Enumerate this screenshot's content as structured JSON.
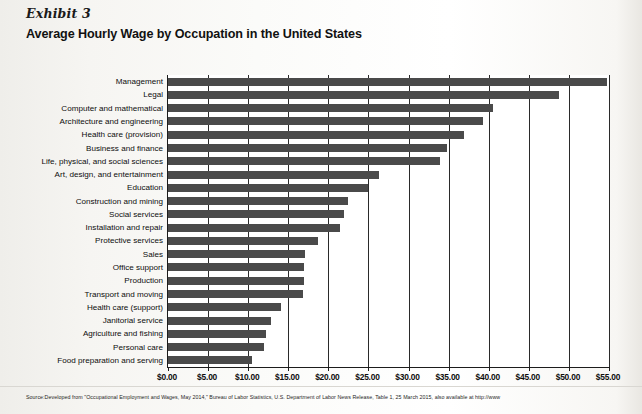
{
  "header": {
    "exhibit_label": "Exhibit 3",
    "title": "Average Hourly Wage by Occupation in the United States"
  },
  "source": {
    "text": "Source:Developed from \"Occupational Employment and Wages, May 2014,\" Bureau of Labor Statistics, U.S. Department of Labor News Release, Table 1, 25 March 2015, also available at http://www"
  },
  "chart_data": {
    "type": "bar",
    "orientation": "horizontal",
    "title": "Average Hourly Wage by Occupation in the United States",
    "xlabel": "",
    "ylabel": "",
    "xlim": [
      0,
      55
    ],
    "xtick_labels": [
      "$0.00",
      "$5.00",
      "$10.00",
      "$15.00",
      "$20.00",
      "$25.00",
      "$30.00",
      "$35.00",
      "$40.00",
      "$45.00",
      "$50.00",
      "$55.00"
    ],
    "xtick_values": [
      0,
      5,
      10,
      15,
      20,
      25,
      30,
      35,
      40,
      45,
      50,
      55
    ],
    "grid": true,
    "legend": false,
    "bar_color": "#4a4a4a",
    "categories": [
      "Management",
      "Legal",
      "Computer and mathematical",
      "Architecture and engineering",
      "Health care (provision)",
      "Business and finance",
      "Life, physical, and social sciences",
      "Art, design, and entertainment",
      "Education",
      "Construction and mining",
      "Social services",
      "Installation and repair",
      "Protective services",
      "Sales",
      "Office support",
      "Production",
      "Transport and moving",
      "Health care (support)",
      "Janitorial service",
      "Agriculture and fishing",
      "Personal care",
      "Food preparation and serving"
    ],
    "values": [
      54.8,
      48.8,
      40.5,
      39.3,
      36.9,
      34.8,
      33.9,
      26.3,
      25.0,
      22.5,
      21.9,
      21.4,
      18.7,
      17.1,
      17.0,
      17.0,
      16.8,
      14.1,
      12.9,
      12.2,
      12.0,
      10.5
    ]
  }
}
